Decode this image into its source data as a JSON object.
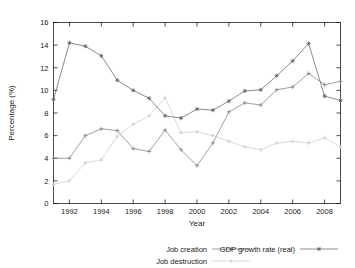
{
  "chart_data": {
    "type": "line",
    "title": "",
    "xlabel": "Year",
    "ylabel": "Percentage (%)",
    "xlim": [
      1991,
      2009
    ],
    "ylim": [
      0,
      16
    ],
    "ytick_step": 2,
    "yticks": [
      0,
      2,
      4,
      6,
      8,
      10,
      12,
      14,
      16
    ],
    "xticks": [
      1992,
      1994,
      1996,
      1998,
      2000,
      2002,
      2004,
      2006,
      2008
    ],
    "xtick_labels": [
      "1992",
      "1994",
      "1996",
      "1998",
      "2000",
      "2002",
      "2004",
      "2006",
      "2008"
    ],
    "ytick_labels": [
      "0",
      "2",
      "4",
      "6",
      "8",
      "10",
      "12",
      "14",
      "16"
    ],
    "grid": false,
    "legend_position": "bottom",
    "x": [
      1991,
      1992,
      1993,
      1994,
      1995,
      1996,
      1997,
      1998,
      1999,
      2000,
      2001,
      2002,
      2003,
      2004,
      2005,
      2006,
      2007,
      2008,
      2009
    ],
    "series": [
      {
        "name": "Job creation",
        "color": "#777777",
        "marker": "plus",
        "values": [
          4.0,
          4.0,
          6.0,
          6.6,
          6.45,
          4.85,
          4.6,
          6.5,
          4.75,
          3.35,
          5.35,
          8.1,
          8.9,
          8.7,
          10.05,
          10.3,
          11.5,
          10.5,
          10.8
        ]
      },
      {
        "name": "Job destruction",
        "color": "#c9c9c9",
        "marker": "plus",
        "values": [
          1.7,
          2.0,
          3.6,
          3.85,
          5.95,
          7.0,
          7.75,
          9.35,
          6.25,
          6.35,
          6.0,
          5.5,
          5.0,
          4.75,
          5.35,
          5.5,
          5.35,
          5.8,
          5.0
        ]
      },
      {
        "name": "GDP growth rate (real)",
        "color": "#5a5a5a",
        "marker": "star",
        "values": [
          9.2,
          14.2,
          13.9,
          13.05,
          10.9,
          10.0,
          9.3,
          7.75,
          7.55,
          8.35,
          8.25,
          9.05,
          9.95,
          10.05,
          11.3,
          12.6,
          14.15,
          9.5,
          9.1
        ]
      }
    ]
  },
  "legend": {
    "items": [
      {
        "label": "Job creation"
      },
      {
        "label": "Job destruction"
      },
      {
        "label": "GDP growth rate (real)"
      }
    ]
  }
}
